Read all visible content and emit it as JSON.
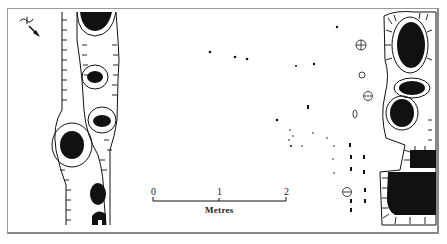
{
  "figure": {
    "type": "archaeological site plan",
    "north_arrow": {
      "label": "N",
      "direction": "south-east"
    },
    "scale_bar": {
      "ticks": [
        "0",
        "1",
        "2"
      ],
      "unit_label": "Metres"
    },
    "colors": {
      "ink": "#111111",
      "paper": "#ffffff",
      "frame": "#9a9a9a"
    }
  }
}
